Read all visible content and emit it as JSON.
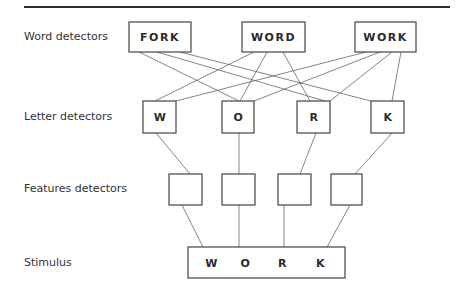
{
  "levels": {
    "word": "Word detectors",
    "letter": "Letter detectors",
    "features": "Features detectors",
    "stimulus": "Stimulus"
  },
  "word_detectors": [
    "FORK",
    "WORD",
    "WORK"
  ],
  "letter_detectors": [
    "W",
    "O",
    "R",
    "K"
  ],
  "feature_detectors_count": 4,
  "stimulus_letters": [
    "W",
    "O",
    "R",
    "K"
  ],
  "connections": {
    "word_to_letter": [
      [
        "FORK",
        "O"
      ],
      [
        "FORK",
        "R"
      ],
      [
        "FORK",
        "K"
      ],
      [
        "WORD",
        "W"
      ],
      [
        "WORD",
        "O"
      ],
      [
        "WORD",
        "R"
      ],
      [
        "WORK",
        "W"
      ],
      [
        "WORK",
        "O"
      ],
      [
        "WORK",
        "R"
      ],
      [
        "WORK",
        "K"
      ]
    ],
    "letter_to_feature": [
      [
        "W",
        1
      ],
      [
        "O",
        2
      ],
      [
        "R",
        3
      ],
      [
        "K",
        4
      ]
    ],
    "feature_to_stimulus": [
      [
        1,
        "W"
      ],
      [
        2,
        "O"
      ],
      [
        3,
        "R"
      ],
      [
        4,
        "K"
      ]
    ]
  }
}
